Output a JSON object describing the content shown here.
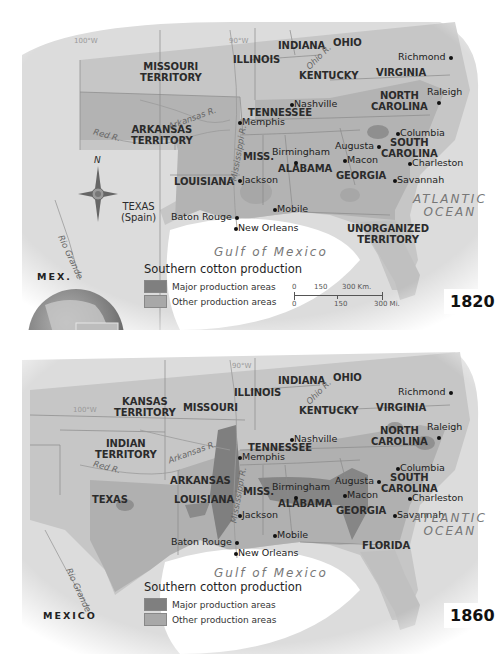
{
  "colors": {
    "land": "#cfcfcf",
    "land_outside": "#dedede",
    "us_south": "#b9b9b9",
    "major_production": "#7f7f7f",
    "other_production": "#a8a8a8",
    "water": "#ffffff",
    "border": "#8a8a8a",
    "text": "#2b2b2b"
  },
  "maps": [
    {
      "year": "1820",
      "legend": {
        "title": "Southern cotton production",
        "items": [
          {
            "label": "Major production areas",
            "color": "#7f7f7f"
          },
          {
            "label": "Other production areas",
            "color": "#a8a8a8"
          }
        ]
      },
      "scale": {
        "km_labels": [
          "0",
          "150",
          "300 Km."
        ],
        "mi_labels": [
          "0",
          "150",
          "300 Mi."
        ]
      },
      "gridlines": [
        "100°W",
        "90°W"
      ],
      "regions": [
        {
          "name": "MISSOURI TERRITORY",
          "line1": "MISSOURI",
          "line2": "TERRITORY"
        },
        {
          "name": "ARKANSAS TERRITORY",
          "line1": "ARKANSAS",
          "line2": "TERRITORY"
        },
        {
          "name": "ILLINOIS",
          "line1": "ILLINOIS"
        },
        {
          "name": "INDIANA",
          "line1": "INDIANA"
        },
        {
          "name": "OHIO",
          "line1": "OHIO"
        },
        {
          "name": "KENTUCKY",
          "line1": "KENTUCKY"
        },
        {
          "name": "VIRGINIA",
          "line1": "VIRGINIA"
        },
        {
          "name": "NORTH CAROLINA",
          "line1": "NORTH",
          "line2": "CAROLINA"
        },
        {
          "name": "TENNESSEE",
          "line1": "TENNESSEE"
        },
        {
          "name": "SOUTH CAROLINA",
          "line1": "SOUTH",
          "line2": "CAROLINA"
        },
        {
          "name": "GEORGIA",
          "line1": "GEORGIA"
        },
        {
          "name": "ALABAMA",
          "line1": "ALABAMA"
        },
        {
          "name": "MISS.",
          "line1": "MISS."
        },
        {
          "name": "LOUISIANA",
          "line1": "LOUISIANA"
        },
        {
          "name": "TEXAS (Spain)",
          "line1": "TEXAS",
          "line2": "(Spain)"
        },
        {
          "name": "UNORGANIZED TERRITORY",
          "line1": "UNORGANIZED",
          "line2": "TERRITORY"
        },
        {
          "name": "MEX.",
          "line1": "MEX."
        }
      ],
      "cities": [
        "Richmond",
        "Raleigh",
        "Nashville",
        "Memphis",
        "Columbia",
        "Augusta",
        "Macon",
        "Charleston",
        "Savannah",
        "Birmingham",
        "Jackson",
        "Mobile",
        "Baton Rouge",
        "New Orleans"
      ],
      "rivers": [
        "Arkansas R.",
        "Red R.",
        "Mississippi R.",
        "Ohio R.",
        "Rio Grande"
      ],
      "water": [
        "Gulf of Mexico",
        "ATLANTIC",
        "OCEAN"
      ],
      "compass_label": "N"
    },
    {
      "year": "1860",
      "legend": {
        "title": "Southern cotton production",
        "items": [
          {
            "label": "Major production areas",
            "color": "#7f7f7f"
          },
          {
            "label": "Other production areas",
            "color": "#a8a8a8"
          }
        ]
      },
      "gridlines": [
        "100°W",
        "90°W"
      ],
      "regions": [
        {
          "name": "KANSAS TERRITORY",
          "line1": "KANSAS",
          "line2": "TERRITORY"
        },
        {
          "name": "MISSOURI",
          "line1": "MISSOURI"
        },
        {
          "name": "ILLINOIS",
          "line1": "ILLINOIS"
        },
        {
          "name": "INDIANA",
          "line1": "INDIANA"
        },
        {
          "name": "OHIO",
          "line1": "OHIO"
        },
        {
          "name": "KENTUCKY",
          "line1": "KENTUCKY"
        },
        {
          "name": "VIRGINIA",
          "line1": "VIRGINIA"
        },
        {
          "name": "NORTH CAROLINA",
          "line1": "NORTH",
          "line2": "CAROLINA"
        },
        {
          "name": "INDIAN TERRITORY",
          "line1": "INDIAN",
          "line2": "TERRITORY"
        },
        {
          "name": "TENNESSEE",
          "line1": "TENNESSEE"
        },
        {
          "name": "ARKANSAS",
          "line1": "ARKANSAS"
        },
        {
          "name": "SOUTH CAROLINA",
          "line1": "SOUTH",
          "line2": "CAROLINA"
        },
        {
          "name": "MISS.",
          "line1": "MISS."
        },
        {
          "name": "ALABAMA",
          "line1": "ALABAMA"
        },
        {
          "name": "GEORGIA",
          "line1": "GEORGIA"
        },
        {
          "name": "TEXAS",
          "line1": "TEXAS"
        },
        {
          "name": "LOUISIANA",
          "line1": "LOUISIANA"
        },
        {
          "name": "FLORIDA",
          "line1": "FLORIDA"
        },
        {
          "name": "MEXICO",
          "line1": "MEXICO"
        }
      ],
      "cities": [
        "Richmond",
        "Raleigh",
        "Nashville",
        "Memphis",
        "Columbia",
        "Augusta",
        "Macon",
        "Charleston",
        "Savannah",
        "Birmingham",
        "Jackson",
        "Mobile",
        "Baton Rouge",
        "New Orleans"
      ],
      "rivers": [
        "Arkansas R.",
        "Red R.",
        "Mississippi R.",
        "Ohio R.",
        "Rio Grande"
      ],
      "water": [
        "Gulf of Mexico",
        "ATLANTIC",
        "OCEAN"
      ]
    }
  ]
}
